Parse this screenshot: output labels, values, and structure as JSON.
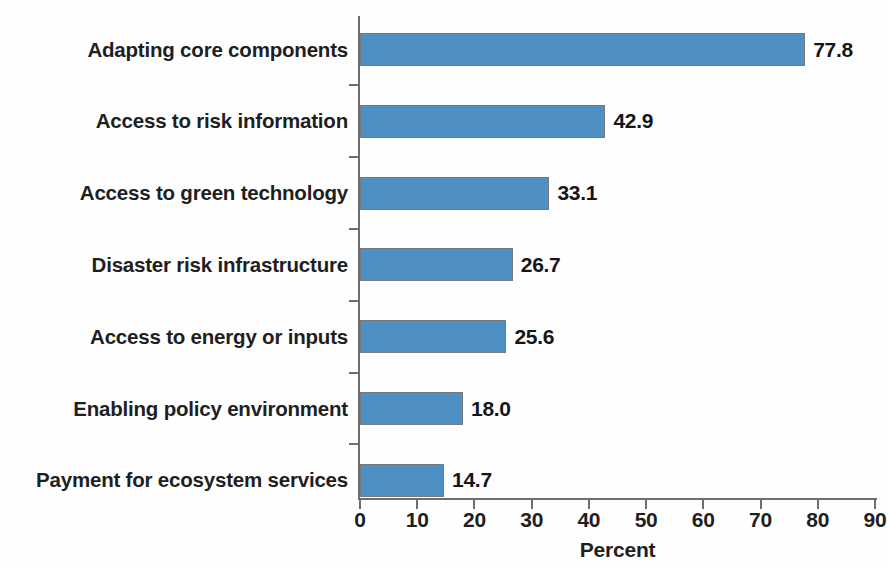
{
  "chart_data": {
    "type": "bar",
    "orientation": "horizontal",
    "title": "",
    "subtitle": "",
    "xlabel": "Percent",
    "ylabel": "",
    "categories": [
      "Adapting core components",
      "Access to risk information",
      "Access to green technology",
      "Disaster risk infrastructure",
      "Access to energy or inputs",
      "Enabling policy environment",
      "Payment for ecosystem services"
    ],
    "values": [
      77.8,
      42.9,
      33.1,
      26.7,
      25.6,
      18.0,
      14.7
    ],
    "value_labels": [
      "77.8",
      "42.9",
      "33.1",
      "26.7",
      "25.6",
      "18.0",
      "14.7"
    ],
    "xlim": [
      0,
      90
    ],
    "xtick_step": 10,
    "xticks": [
      0,
      10,
      20,
      30,
      40,
      50,
      60,
      70,
      80,
      90
    ],
    "xtick_labels": [
      "0",
      "10",
      "20",
      "30",
      "40",
      "50",
      "60",
      "70",
      "80",
      "90"
    ],
    "grid": false,
    "legend": null,
    "bar_color": "#4e8fc4",
    "bar_border_color": "#767a7d",
    "axis_color": "#6e6e70",
    "text_color": "#1f1f22",
    "background_color": "#fefefe"
  }
}
